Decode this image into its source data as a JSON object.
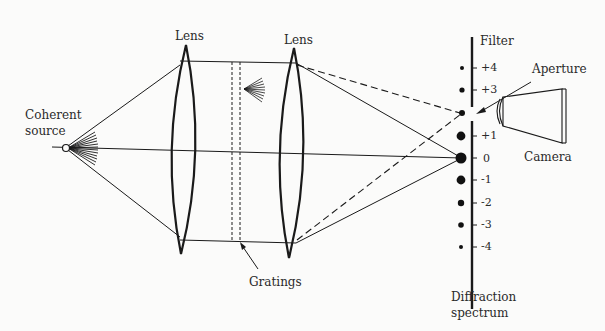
{
  "labels": {
    "lens_left": "Lens",
    "lens_right": "Lens",
    "source": "Coherent\nsource",
    "source_line1": "Coherent",
    "source_line2": "source",
    "filter": "Filter",
    "aperture": "Aperture",
    "camera": "Camera",
    "gratings": "Gratings",
    "spectrum_line1": "Diffraction",
    "spectrum_line2": "spectrum"
  },
  "orders": [
    {
      "label": "+4",
      "y": 68,
      "r": 2.0
    },
    {
      "label": "+3",
      "y": 90,
      "r": 2.6
    },
    {
      "label": "+2",
      "y": 113,
      "r": 3.0,
      "aperture": true
    },
    {
      "label": "+1",
      "y": 136,
      "r": 4.4
    },
    {
      "label": "0",
      "y": 158,
      "r": 5.5
    },
    {
      "label": "-1",
      "y": 180,
      "r": 4.4
    },
    {
      "label": "-2",
      "y": 203,
      "r": 3.2
    },
    {
      "label": "-3",
      "y": 225,
      "r": 2.8
    },
    {
      "label": "-4",
      "y": 247,
      "r": 2.0
    }
  ],
  "colors": {
    "ink": "#1a1a1a",
    "background": "#fbfbfa"
  }
}
